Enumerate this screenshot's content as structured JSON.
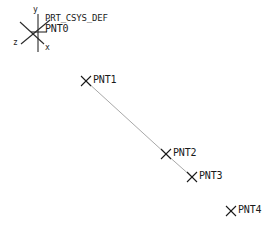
{
  "viewport": {
    "width": 270,
    "height": 234,
    "background_color": "#ffffff",
    "entity_color": "#1a1a1a",
    "curve_color": "#9a9a9a"
  },
  "coordinate_system": {
    "name": "PRT_CSYS_DEF",
    "origin_point_name": "PNT0",
    "origin": {
      "x": 38,
      "y": 32
    },
    "axes": [
      {
        "label": "y",
        "label_x": 33,
        "label_y": 8,
        "end_x": 38,
        "end_y": 14
      },
      {
        "label": "x",
        "label_x": 45,
        "label_y": 46,
        "end_x": 43,
        "end_y": 45
      },
      {
        "label": "z",
        "label_x": 14,
        "label_y": 42,
        "end_x": 22,
        "end_y": 42
      }
    ],
    "name_label": {
      "x": 45,
      "y": 15
    },
    "point_label": {
      "x": 45,
      "y": 25
    }
  },
  "datum_points": [
    {
      "name": "PNT1",
      "marker_x": 86,
      "marker_y": 81,
      "label_x": 93,
      "label_y": 76
    },
    {
      "name": "PNT2",
      "marker_x": 166,
      "marker_y": 154,
      "label_x": 173,
      "label_y": 149
    },
    {
      "name": "PNT3",
      "marker_x": 192,
      "marker_y": 177,
      "label_x": 199,
      "label_y": 172
    },
    {
      "name": "PNT4",
      "marker_x": 231,
      "marker_y": 211,
      "label_x": 238,
      "label_y": 206
    }
  ],
  "curve": {
    "name": "datum-curve",
    "points": [
      {
        "x": 86,
        "y": 81
      },
      {
        "x": 166,
        "y": 154
      },
      {
        "x": 192,
        "y": 177
      }
    ]
  }
}
